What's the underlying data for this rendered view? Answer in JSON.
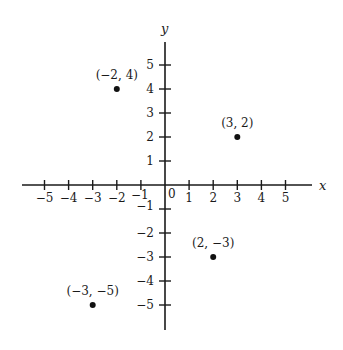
{
  "chart_data": {
    "type": "scatter",
    "title": "",
    "xlabel": "x",
    "ylabel": "y",
    "xlim": [
      -5.8,
      6
    ],
    "ylim": [
      -5.9,
      5.8
    ],
    "grid": false,
    "origin_label": "0",
    "x_ticks": [
      -5,
      -4,
      -3,
      -2,
      -1,
      1,
      2,
      3,
      4,
      5
    ],
    "x_tick_labels": [
      "−5",
      "−4",
      "−3",
      "−2",
      "−1",
      "1",
      "2",
      "3",
      "4",
      "5"
    ],
    "y_ticks": [
      5,
      4,
      3,
      2,
      1,
      -1,
      -2,
      -3,
      -4,
      -5
    ],
    "y_tick_labels": [
      "5",
      "4",
      "3",
      "2",
      "1",
      "−1",
      "−2",
      "−3",
      "−4",
      "−5"
    ],
    "points": [
      {
        "x": -2,
        "y": 4,
        "label": "(−2, 4)"
      },
      {
        "x": 3,
        "y": 2,
        "label": "(3, 2)"
      },
      {
        "x": 2,
        "y": -3,
        "label": "(2, −3)"
      },
      {
        "x": -3,
        "y": -5,
        "label": "(−3, −5)"
      }
    ]
  },
  "colors": {
    "axis": "#1a1a1a",
    "point": "#111111",
    "background": "#ffffff"
  }
}
